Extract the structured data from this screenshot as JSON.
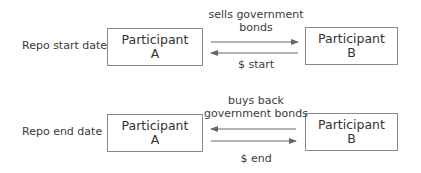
{
  "diagram": {
    "rows": [
      {
        "label": "Repo start date",
        "left": {
          "title": "Participant",
          "id": "A"
        },
        "right": {
          "title": "Participant",
          "id": "B"
        },
        "top_caption": [
          "sells government",
          "bonds"
        ],
        "top_arrow_direction": "right",
        "bottom_arrow_direction": "left",
        "bottom_caption": "$ start"
      },
      {
        "label": "Repo end date",
        "left": {
          "title": "Participant",
          "id": "A"
        },
        "right": {
          "title": "Participant",
          "id": "B"
        },
        "top_caption": [
          "buys back",
          "government bonds"
        ],
        "top_arrow_direction": "left",
        "bottom_arrow_direction": "right",
        "bottom_caption": "$ end"
      }
    ],
    "colors": {
      "line": "#666666",
      "box_border": "#8a8a8a",
      "text": "#333333"
    }
  }
}
